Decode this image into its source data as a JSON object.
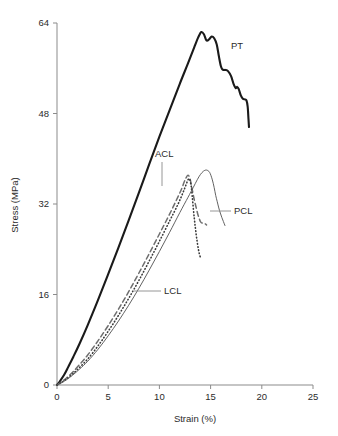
{
  "chart_data": {
    "type": "line",
    "title": "",
    "xlabel": "Strain (%)",
    "ylabel": "Stress (MPa)",
    "xlim": [
      0,
      25
    ],
    "ylim": [
      0,
      64
    ],
    "xticks": [
      0,
      5,
      10,
      15,
      20,
      25
    ],
    "yticks": [
      0,
      16,
      32,
      48,
      64
    ],
    "xtick_labels": [
      "0",
      "5",
      "10",
      "15",
      "20",
      "25"
    ],
    "ytick_labels": [
      "0",
      "16",
      "32",
      "48",
      "64"
    ],
    "grid": false,
    "legend_position": "inline-annotations",
    "series": [
      {
        "name": "PT",
        "label": "PT",
        "style": "solid-thick",
        "color": "#1a1a1a",
        "x": [
          0,
          0.3,
          0.7,
          1.1,
          1.6,
          2.2,
          3.0,
          4.0,
          5.0,
          6.0,
          7.0,
          8.0,
          9.0,
          10.0,
          11.0,
          12.0,
          12.8,
          13.4,
          13.8,
          14.1,
          14.35,
          14.6,
          14.9,
          15.1,
          15.35,
          15.6,
          15.8,
          16.0,
          16.15,
          16.3,
          16.45,
          16.7,
          17.0,
          17.25,
          17.45,
          17.6,
          17.75,
          17.95,
          18.15,
          18.35,
          18.5,
          18.62,
          18.7,
          18.75
        ],
        "y": [
          0,
          0.7,
          1.8,
          3.2,
          5.0,
          7.3,
          10.6,
          15.0,
          19.6,
          24.3,
          29.1,
          34.0,
          39.0,
          43.9,
          48.6,
          53.3,
          56.9,
          59.7,
          61.5,
          62.4,
          62.0,
          60.9,
          61.2,
          61.6,
          61.3,
          60.2,
          58.2,
          56.4,
          55.8,
          55.7,
          55.7,
          55.5,
          54.6,
          53.2,
          52.5,
          52.7,
          52.3,
          51.2,
          50.6,
          50.5,
          50.3,
          49.2,
          47.0,
          45.6
        ]
      },
      {
        "name": "ACL",
        "label": "ACL",
        "style": "dashed",
        "color": "#6e6e6e",
        "x": [
          0,
          0.4,
          0.9,
          1.5,
          2.2,
          3.0,
          4.0,
          5.0,
          6.0,
          7.0,
          8.0,
          9.0,
          10.0,
          10.8,
          11.4,
          11.9,
          12.2,
          12.4,
          12.6,
          12.8,
          13.0,
          13.2,
          13.4,
          13.6,
          13.75,
          13.9,
          14.0,
          14.1,
          14.25,
          14.45,
          14.6
        ],
        "y": [
          0,
          0.5,
          1.2,
          2.2,
          3.6,
          5.3,
          7.8,
          10.5,
          13.4,
          16.5,
          19.8,
          23.2,
          26.7,
          29.5,
          31.7,
          33.6,
          34.8,
          35.8,
          36.6,
          37.1,
          36.4,
          34.6,
          32.8,
          31.3,
          30.2,
          29.4,
          28.9,
          28.7,
          28.6,
          28.5,
          28.3
        ]
      },
      {
        "name": "LCL",
        "label": "LCL",
        "style": "dotted",
        "color": "#3a3a3a",
        "x": [
          0,
          0.4,
          0.9,
          1.5,
          2.2,
          3.0,
          4.0,
          5.0,
          6.0,
          7.0,
          8.0,
          9.0,
          10.0,
          11.0,
          11.8,
          12.3,
          12.6,
          12.8,
          12.95,
          13.1,
          13.2,
          13.3,
          13.4,
          13.5,
          13.6,
          13.7,
          13.8,
          13.9,
          14.0
        ],
        "y": [
          0,
          0.4,
          1.0,
          1.9,
          3.1,
          4.6,
          6.9,
          9.5,
          12.3,
          15.3,
          18.5,
          21.9,
          25.4,
          29.0,
          31.9,
          34.0,
          35.4,
          36.3,
          36.4,
          35.2,
          33.5,
          31.5,
          29.6,
          28.0,
          26.5,
          25.2,
          24.1,
          23.2,
          22.6
        ]
      },
      {
        "name": "PCL",
        "label": "PCL",
        "style": "solid-thin",
        "color": "#5a5a5a",
        "x": [
          0,
          0.4,
          0.9,
          1.5,
          2.2,
          3.0,
          4.0,
          5.0,
          6.0,
          7.0,
          8.0,
          9.0,
          10.0,
          11.0,
          12.0,
          12.8,
          13.3,
          13.7,
          14.0,
          14.3,
          14.6,
          14.9,
          15.15,
          15.35,
          15.5,
          15.65,
          15.8,
          15.95,
          16.1,
          16.25,
          16.4
        ],
        "y": [
          0,
          0.35,
          0.9,
          1.7,
          2.8,
          4.2,
          6.3,
          8.7,
          11.3,
          14.1,
          17.1,
          20.3,
          23.6,
          27.0,
          30.5,
          33.2,
          34.9,
          36.3,
          37.2,
          37.8,
          38.0,
          37.6,
          36.4,
          34.9,
          33.5,
          32.4,
          31.3,
          30.4,
          29.6,
          28.9,
          28.2
        ]
      }
    ],
    "annotations": [
      {
        "name": "PT",
        "text": "PT",
        "text_x": 231,
        "text_y": 49,
        "anchor": "start",
        "leader": null
      },
      {
        "name": "ACL",
        "text": "ACL",
        "text_x": 155,
        "text_y": 157,
        "anchor": "start",
        "leader": [
          [
            162,
            162
          ],
          [
            162,
            186
          ]
        ]
      },
      {
        "name": "PCL",
        "text": "PCL",
        "text_x": 234,
        "text_y": 214,
        "anchor": "start",
        "leader": [
          [
            231,
            211
          ],
          [
            210,
            211
          ]
        ]
      },
      {
        "name": "LCL",
        "text": "LCL",
        "text_x": 164,
        "text_y": 294,
        "anchor": "start",
        "leader": [
          [
            161,
            291
          ],
          [
            134,
            291
          ]
        ]
      }
    ]
  },
  "axis": {
    "x_origin_px": 57,
    "x_end_px": 313,
    "y_origin_px": 385,
    "y_top_px": 23
  }
}
